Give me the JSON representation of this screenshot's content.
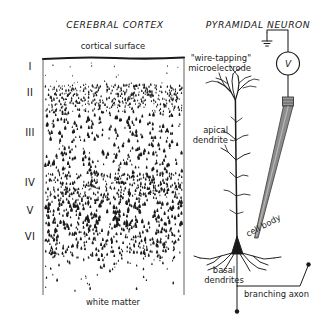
{
  "figure": {
    "panels": {
      "left_title": "CEREBRAL CORTEX",
      "right_title": "PYRAMIDAL NEURON"
    },
    "cortex": {
      "surface_label": "cortical surface",
      "bottom_label": "white matter",
      "layers": [
        {
          "numeral": "I",
          "y": 70
        },
        {
          "numeral": "II",
          "y": 96
        },
        {
          "numeral": "III",
          "y": 136
        },
        {
          "numeral": "IV",
          "y": 186
        },
        {
          "numeral": "V",
          "y": 214
        },
        {
          "numeral": "VI",
          "y": 240
        }
      ]
    },
    "neuron": {
      "electrode_label_line1": "\"wire-tapping\"",
      "electrode_label_line2": "microelectrode",
      "voltmeter_symbol": "V",
      "apical_label_line1": "apical",
      "apical_label_line2": "dendrite",
      "soma_label": "cell body",
      "basal_label_line1": "basal",
      "basal_label_line2": "dendrites",
      "axon_label": "branching axon"
    },
    "colors": {
      "ink": "#1a1a1a",
      "electrode_fill": "#8c8c8c",
      "electrode_edge": "#3a3a3a",
      "background": "#ffffff"
    }
  }
}
